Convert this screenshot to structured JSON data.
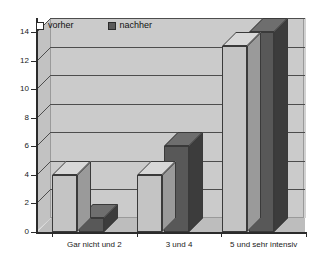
{
  "chart_data": {
    "type": "bar",
    "title": "",
    "subtitle": "",
    "xlabel": "",
    "ylabel": "",
    "categories": [
      "Gar nicht und 2",
      "3 und 4",
      "5 und sehr intensiv"
    ],
    "series": [
      {
        "name": "vorher",
        "values": [
          4,
          4,
          13
        ],
        "color": "#c4c4c4"
      },
      {
        "name": "nachher",
        "values": [
          1,
          6,
          14
        ],
        "color": "#585858"
      }
    ],
    "ylim": [
      0,
      14
    ],
    "ytick_labels": [
      "14",
      "12",
      "10",
      "8",
      "6",
      "4",
      "2",
      "0"
    ],
    "ytick_values": [
      14,
      12,
      10,
      8,
      6,
      4,
      2,
      0
    ],
    "grid": true,
    "legend_position": "top-inside",
    "style": "3d-column"
  },
  "legend": {
    "entries": [
      {
        "label": "vorher",
        "swatch": "light-square"
      },
      {
        "label": "nachher",
        "swatch": "dark-square"
      }
    ]
  },
  "axes": {
    "y_ticks": [
      "14",
      "12",
      "10",
      "8",
      "6",
      "4",
      "2",
      "0"
    ],
    "x_labels": [
      "Gar nicht und 2",
      "3 und 4",
      "5 und sehr intensiv"
    ]
  },
  "colors": {
    "plot_background": "#cbcbcb",
    "floor": "#bdbdbd",
    "side_wall": "#c2c2c2",
    "bar_light": "#c4c4c4",
    "bar_dark": "#585858",
    "gridline": "#4d4d4d",
    "axis": "#2b2b2b",
    "page_background": "#ffffff"
  }
}
